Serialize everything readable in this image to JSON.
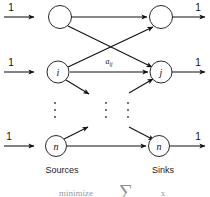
{
  "figure": {
    "captions": {
      "left": "Sources",
      "right": "Sinks"
    },
    "flow_label": "1",
    "edge_label": {
      "base": "a",
      "subscript": "ij"
    },
    "formula": {
      "word": "minimize",
      "sigma": "∑",
      "tail": "x"
    },
    "ellipsis_glyph": "⋮"
  },
  "nodes": {
    "sources": [
      {
        "id": "s1",
        "label": "",
        "row": "top"
      },
      {
        "id": "si",
        "label": "i",
        "row": "middle"
      },
      {
        "id": "sn",
        "label": "n",
        "row": "bottom"
      }
    ],
    "sinks": [
      {
        "id": "t1",
        "label": "",
        "row": "top"
      },
      {
        "id": "tj",
        "label": "j",
        "row": "middle"
      },
      {
        "id": "tn",
        "label": "n",
        "row": "bottom"
      }
    ]
  },
  "rows": [
    {
      "name": "top",
      "inflow": "1",
      "outflow": "1"
    },
    {
      "name": "middle",
      "inflow": "1",
      "outflow": "1"
    },
    {
      "name": "bottom",
      "inflow": "1",
      "outflow": "1"
    }
  ],
  "colors": {
    "stroke": "#111111",
    "background": "#ffffff",
    "text": "#1a1a1a",
    "faded": "#9a9a9a"
  }
}
